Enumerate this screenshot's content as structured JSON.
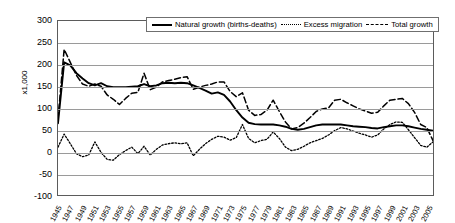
{
  "chart_data": {
    "type": "line",
    "title": "",
    "xlabel": "",
    "ylabel": "x1,000",
    "ylim": [
      -100,
      300
    ],
    "ytick_values": [
      300,
      250,
      200,
      150,
      100,
      50,
      0,
      -50,
      -100
    ],
    "ytick_labels": [
      "300",
      "250",
      "200",
      "150",
      "100",
      "50",
      "0",
      "-50",
      "-100"
    ],
    "grid": true,
    "legend_position": "top-center",
    "x": [
      1945,
      1946,
      1947,
      1948,
      1949,
      1950,
      1951,
      1952,
      1953,
      1954,
      1955,
      1956,
      1957,
      1958,
      1959,
      1960,
      1961,
      1962,
      1963,
      1964,
      1965,
      1966,
      1967,
      1968,
      1969,
      1970,
      1971,
      1972,
      1973,
      1974,
      1975,
      1976,
      1977,
      1978,
      1979,
      1980,
      1981,
      1982,
      1983,
      1984,
      1985,
      1986,
      1987,
      1988,
      1989,
      1990,
      1991,
      1992,
      1993,
      1994,
      1995,
      1996,
      1997,
      1998,
      1999,
      2000,
      2001,
      2002,
      2003,
      2004,
      2005,
      2006
    ],
    "xtick_labels": [
      "1945",
      "1947",
      "1949",
      "1951",
      "1953",
      "1955",
      "1957",
      "1959",
      "1961",
      "1963",
      "1965",
      "1967",
      "1969",
      "1971",
      "1973",
      "1975",
      "1977",
      "1979",
      "1981",
      "1983",
      "1985",
      "1987",
      "1989",
      "1991",
      "1993",
      "1995",
      "1997",
      "1999",
      "2001",
      "2003",
      "2005"
    ],
    "series": [
      {
        "name": "Natural growth (births-deaths)",
        "style": "solid",
        "color": "#000000",
        "values": [
          65,
          205,
          198,
          180,
          168,
          157,
          152,
          157,
          150,
          148,
          148,
          148,
          149,
          150,
          155,
          150,
          152,
          157,
          158,
          157,
          158,
          157,
          152,
          146,
          140,
          133,
          136,
          130,
          115,
          95,
          78,
          66,
          63,
          62,
          62,
          62,
          60,
          57,
          52,
          50,
          52,
          56,
          60,
          62,
          62,
          62,
          62,
          60,
          58,
          57,
          56,
          54,
          53,
          56,
          58,
          60,
          60,
          58,
          55,
          52,
          50,
          48
        ]
      },
      {
        "name": "Excess migration",
        "style": "dotted",
        "color": "#000000",
        "values": [
          10,
          40,
          18,
          -5,
          -12,
          -8,
          22,
          -2,
          -18,
          -20,
          -7,
          2,
          10,
          -5,
          12,
          -8,
          5,
          15,
          18,
          20,
          18,
          20,
          -10,
          5,
          18,
          28,
          35,
          33,
          26,
          32,
          62,
          30,
          20,
          25,
          28,
          45,
          30,
          10,
          2,
          5,
          12,
          20,
          25,
          30,
          38,
          48,
          55,
          52,
          47,
          42,
          38,
          33,
          38,
          52,
          62,
          68,
          67,
          50,
          32,
          14,
          10,
          22
        ]
      },
      {
        "name": "Total growth",
        "style": "dashed",
        "color": "#000000",
        "values": [
          75,
          235,
          205,
          175,
          155,
          150,
          155,
          150,
          130,
          120,
          108,
          122,
          134,
          136,
          180,
          142,
          148,
          160,
          163,
          166,
          170,
          172,
          143,
          148,
          152,
          155,
          160,
          160,
          138,
          126,
          135,
          95,
          83,
          85,
          95,
          118,
          92,
          68,
          52,
          55,
          65,
          78,
          92,
          98,
          100,
          118,
          120,
          112,
          105,
          98,
          93,
          88,
          90,
          105,
          118,
          120,
          122,
          110,
          90,
          62,
          55,
          25
        ]
      }
    ]
  },
  "legend": {
    "items": [
      {
        "label": "Natural growth (births-deaths)",
        "swatch": "solid-line-swatch"
      },
      {
        "label": "Excess migration",
        "swatch": "dotted-line-swatch"
      },
      {
        "label": "Total growth",
        "swatch": "dashed-line-swatch"
      }
    ]
  },
  "axes": {
    "y_axis_title": "x1,000"
  }
}
